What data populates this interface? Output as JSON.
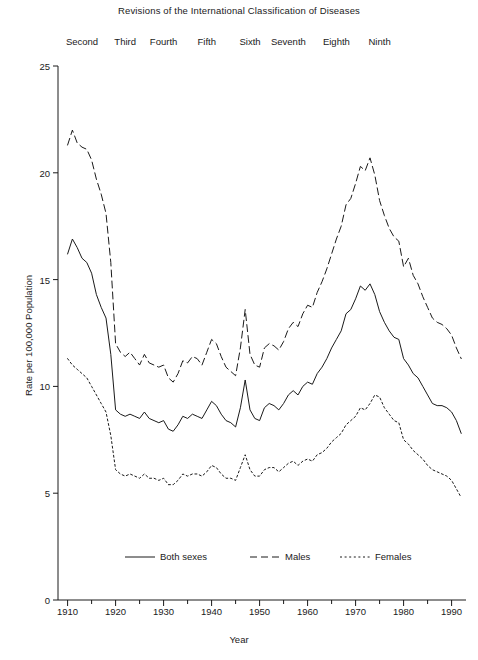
{
  "chart_data": {
    "type": "line",
    "title": "Revisions  of the International Classification of Diseases",
    "xlabel": "Year",
    "ylabel": "Rate per 100,000 Population",
    "xlim": [
      1908,
      1993
    ],
    "ylim": [
      0,
      25
    ],
    "grid": false,
    "legend_position": "bottom-center",
    "y_ticks": [
      0,
      5,
      10,
      15,
      20,
      25
    ],
    "y_tick_labels": [
      "0",
      "5",
      "10",
      "15",
      "20",
      "25"
    ],
    "x_ticks": [
      1910,
      1920,
      1930,
      1940,
      1950,
      1960,
      1970,
      1980,
      1990
    ],
    "x_tick_labels": [
      "1910",
      "1920",
      "1930",
      "1940",
      "1950",
      "1960",
      "1970",
      "1980",
      "1990"
    ],
    "x_minor_ticks": [
      1915,
      1925,
      1935,
      1945,
      1955,
      1965,
      1975,
      1985
    ],
    "annotations": [
      {
        "label": "Second",
        "year": 1913
      },
      {
        "label": "Third",
        "year": 1922
      },
      {
        "label": "Fourth",
        "year": 1930
      },
      {
        "label": "Fifth",
        "year": 1939
      },
      {
        "label": "Sixth",
        "year": 1948
      },
      {
        "label": "Seventh",
        "year": 1956
      },
      {
        "label": "Eighth",
        "year": 1966
      },
      {
        "label": "Ninth",
        "year": 1975
      }
    ],
    "x": [
      1910,
      1911,
      1912,
      1913,
      1914,
      1915,
      1916,
      1917,
      1918,
      1919,
      1920,
      1921,
      1922,
      1923,
      1924,
      1925,
      1926,
      1927,
      1928,
      1929,
      1930,
      1931,
      1932,
      1933,
      1934,
      1935,
      1936,
      1937,
      1938,
      1939,
      1940,
      1941,
      1942,
      1943,
      1944,
      1945,
      1946,
      1947,
      1948,
      1949,
      1950,
      1951,
      1952,
      1953,
      1954,
      1955,
      1956,
      1957,
      1958,
      1959,
      1960,
      1961,
      1962,
      1963,
      1964,
      1965,
      1966,
      1967,
      1968,
      1969,
      1970,
      1971,
      1972,
      1973,
      1974,
      1975,
      1976,
      1977,
      1978,
      1979,
      1980,
      1981,
      1982,
      1983,
      1984,
      1985,
      1986,
      1987,
      1988,
      1989,
      1990,
      1991,
      1992
    ],
    "series": [
      {
        "name": "Both sexes",
        "style": "solid",
        "values": [
          16.2,
          16.9,
          16.5,
          16.0,
          15.8,
          15.3,
          14.3,
          13.7,
          13.2,
          11.5,
          8.9,
          8.7,
          8.6,
          8.7,
          8.6,
          8.5,
          8.8,
          8.5,
          8.4,
          8.3,
          8.4,
          8.0,
          7.9,
          8.2,
          8.6,
          8.5,
          8.7,
          8.6,
          8.5,
          8.9,
          9.3,
          9.1,
          8.7,
          8.4,
          8.3,
          8.1,
          9.0,
          10.3,
          8.9,
          8.5,
          8.4,
          9.0,
          9.2,
          9.1,
          8.9,
          9.2,
          9.6,
          9.8,
          9.6,
          10.0,
          10.2,
          10.1,
          10.6,
          10.9,
          11.3,
          11.8,
          12.2,
          12.6,
          13.4,
          13.6,
          14.1,
          14.7,
          14.5,
          14.8,
          14.3,
          13.5,
          13.0,
          12.6,
          12.3,
          12.2,
          11.3,
          11.0,
          10.6,
          10.4,
          10.0,
          9.6,
          9.2,
          9.1,
          9.1,
          9.0,
          8.8,
          8.4,
          7.8
        ]
      },
      {
        "name": "Males",
        "style": "dashed",
        "values": [
          21.3,
          22.0,
          21.4,
          21.2,
          21.1,
          20.6,
          19.7,
          19.0,
          18.1,
          15.8,
          12.0,
          11.6,
          11.4,
          11.6,
          11.3,
          11.0,
          11.5,
          11.1,
          11.0,
          10.9,
          11.0,
          10.4,
          10.2,
          10.6,
          11.2,
          11.1,
          11.4,
          11.3,
          11.0,
          11.6,
          12.2,
          12.0,
          11.4,
          10.9,
          10.7,
          10.5,
          11.8,
          13.6,
          11.5,
          11.0,
          10.9,
          11.8,
          12.0,
          11.9,
          11.7,
          12.1,
          12.7,
          13.0,
          12.8,
          13.4,
          13.8,
          13.7,
          14.4,
          14.9,
          15.5,
          16.2,
          16.9,
          17.5,
          18.5,
          18.8,
          19.5,
          20.3,
          20.1,
          20.7,
          19.9,
          18.7,
          18.0,
          17.4,
          17.0,
          16.8,
          15.6,
          16.0,
          15.2,
          14.8,
          14.2,
          13.7,
          13.2,
          13.0,
          12.9,
          12.7,
          12.4,
          11.8,
          11.3
        ]
      },
      {
        "name": "Females",
        "style": "dotted",
        "values": [
          11.3,
          11.0,
          10.8,
          10.6,
          10.4,
          10.0,
          9.6,
          9.2,
          8.8,
          7.7,
          6.1,
          5.9,
          5.8,
          5.9,
          5.8,
          5.7,
          5.9,
          5.7,
          5.7,
          5.6,
          5.7,
          5.4,
          5.4,
          5.6,
          5.9,
          5.8,
          5.9,
          5.9,
          5.8,
          6.0,
          6.3,
          6.2,
          5.9,
          5.7,
          5.7,
          5.6,
          6.2,
          6.8,
          6.1,
          5.8,
          5.8,
          6.1,
          6.2,
          6.2,
          6.0,
          6.2,
          6.4,
          6.5,
          6.3,
          6.5,
          6.6,
          6.5,
          6.8,
          6.9,
          7.1,
          7.4,
          7.6,
          7.8,
          8.2,
          8.4,
          8.6,
          9.0,
          8.9,
          9.2,
          9.6,
          9.5,
          9.0,
          8.7,
          8.4,
          8.3,
          7.5,
          7.3,
          7.0,
          6.8,
          6.6,
          6.3,
          6.1,
          6.0,
          5.9,
          5.8,
          5.6,
          5.2,
          4.8
        ]
      }
    ]
  },
  "legend": {
    "items": [
      {
        "label": "Both sexes",
        "style": "solid"
      },
      {
        "label": "Males",
        "style": "dashed"
      },
      {
        "label": "Females",
        "style": "dotted"
      }
    ]
  },
  "colors": {
    "line": "#1a1a1a",
    "axis": "#1a1a1a",
    "background": "#ffffff"
  }
}
